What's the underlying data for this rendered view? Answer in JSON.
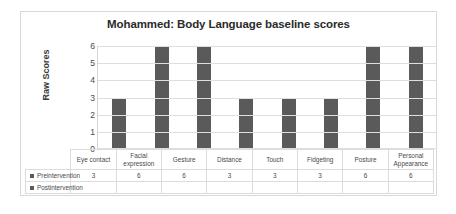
{
  "chart_data": {
    "type": "bar",
    "title": "Mohammed: Body Language baseline scores",
    "xlabel": "",
    "ylabel": "Raw Scores",
    "ylim": [
      0,
      6
    ],
    "yticks": [
      "6",
      "5",
      "4",
      "3",
      "2",
      "1",
      "0"
    ],
    "grid": true,
    "legend_position": "bottom-table",
    "categories": [
      "Eye contact",
      "Facial expression",
      "Gesture",
      "Distance",
      "Touch",
      "Fidgeting",
      "Posture",
      "Personal Appearance"
    ],
    "series": [
      {
        "name": "Preintervention",
        "color": "#5a5a5a",
        "values": [
          3,
          6,
          6,
          3,
          3,
          3,
          6,
          6
        ],
        "labels": [
          "3",
          "6",
          "6",
          "3",
          "3",
          "3",
          "6",
          "6"
        ]
      },
      {
        "name": "Postintervention",
        "color": "#5a5a5a",
        "values": [
          null,
          null,
          null,
          null,
          null,
          null,
          null,
          null
        ],
        "labels": [
          "",
          "",
          "",
          "",
          "",
          "",
          "",
          ""
        ]
      }
    ]
  }
}
